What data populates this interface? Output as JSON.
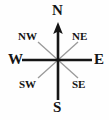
{
  "figure": {
    "name": "compass-rose",
    "background_color": "#fefefe",
    "axis_color": "#151515",
    "diagonal_color": "#9a9a9a",
    "label_color": "#151515"
  },
  "compass": {
    "center": {
      "x": 58,
      "y": 60
    },
    "cardinal_points": [
      {
        "key": "north",
        "label": "N",
        "bearing_degrees": 0
      },
      {
        "key": "east",
        "label": "E",
        "bearing_degrees": 90
      },
      {
        "key": "south",
        "label": "S",
        "bearing_degrees": 180
      },
      {
        "key": "west",
        "label": "W",
        "bearing_degrees": 270
      }
    ],
    "ordinal_points": [
      {
        "key": "northeast",
        "label": "NE",
        "bearing_degrees": 45
      },
      {
        "key": "southeast",
        "label": "SE",
        "bearing_degrees": 135
      },
      {
        "key": "southwest",
        "label": "SW",
        "bearing_degrees": 225
      },
      {
        "key": "northwest",
        "label": "NW",
        "bearing_degrees": 315
      }
    ],
    "north_arrow": {
      "present": true,
      "points_to": "N",
      "tip": {
        "x": 58,
        "y": 23
      }
    }
  }
}
